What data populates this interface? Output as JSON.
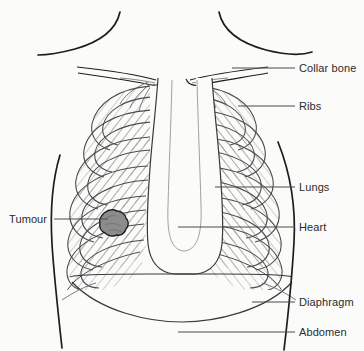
{
  "diagram": {
    "background_color": "#fbfbfa",
    "line_color": "#1d1d1d",
    "rib_line_color": "#555555",
    "tumour_fill_color": "#8c8c8c",
    "tumour_outline_color": "#1d1d1d",
    "leader_line_color": "#4a4a4a",
    "label_text_color": "#2b2b2b"
  },
  "labels": {
    "collar_bone": "Collar bone",
    "ribs": "Ribs",
    "lungs": "Lungs",
    "heart": "Heart",
    "diaphragm": "Diaphragm",
    "abdomen": "Abdomen",
    "tumour": "Tumour"
  },
  "annotations": [
    {
      "name": "collar-bone",
      "label": "Collar bone",
      "side": "right",
      "leader_from_x": 232,
      "leader_to_x": 295,
      "leader_y": 68
    },
    {
      "name": "ribs",
      "label": "Ribs",
      "side": "right",
      "leader_from_x": 238,
      "leader_to_x": 295,
      "leader_y": 106
    },
    {
      "name": "lungs",
      "label": "Lungs",
      "side": "right",
      "leader_from_x": 215,
      "leader_to_x": 295,
      "leader_y": 187
    },
    {
      "name": "heart",
      "label": "Heart",
      "side": "right",
      "leader_from_x": 178,
      "leader_to_x": 295,
      "leader_y": 227
    },
    {
      "name": "diaphragm",
      "label": "Diaphragm",
      "side": "right",
      "leader_from_x": 252,
      "leader_to_x": 295,
      "leader_y": 302
    },
    {
      "name": "abdomen",
      "label": "Abdomen",
      "side": "right",
      "leader_from_x": 178,
      "leader_to_x": 295,
      "leader_y": 332
    },
    {
      "name": "tumour",
      "label": "Tumour",
      "side": "left",
      "leader_from_x": 54,
      "leader_to_x": 104,
      "leader_y": 219
    }
  ],
  "anatomy_parts": [
    "shoulder-left",
    "shoulder-right",
    "collar-bone-left",
    "collar-bone-right",
    "ribcage-left",
    "ribcage-right",
    "sternum-mediastinum",
    "diaphragm-dome",
    "torso-outline-left",
    "torso-outline-right",
    "tumour-mass"
  ]
}
